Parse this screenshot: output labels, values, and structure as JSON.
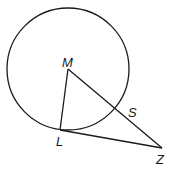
{
  "diagram": {
    "type": "geometry",
    "stroke_color": "#1a1a1a",
    "background": "#ffffff",
    "circle": {
      "center_label": "M",
      "cx": 68,
      "cy": 69,
      "r": 61
    },
    "points": {
      "M": {
        "label": "M",
        "x": 68,
        "y": 69,
        "label_x": 62,
        "label_y": 67
      },
      "L": {
        "label": "L",
        "x": 60,
        "y": 130,
        "label_x": 56,
        "label_y": 146
      },
      "S": {
        "label": "S",
        "x": 115,
        "y": 109,
        "label_x": 128,
        "label_y": 117
      },
      "Z": {
        "label": "Z",
        "x": 162,
        "y": 148,
        "label_x": 156,
        "label_y": 164
      }
    },
    "segments": [
      {
        "from": "M",
        "to": "L"
      },
      {
        "from": "M",
        "to": "Z"
      },
      {
        "from": "L",
        "to": "Z"
      }
    ]
  }
}
